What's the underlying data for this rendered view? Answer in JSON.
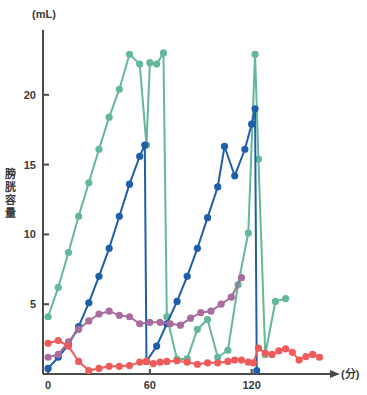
{
  "chart_data": {
    "type": "line",
    "title": "",
    "subtitle": "",
    "xlabel": "(分)",
    "ylabel": "膀胱容量",
    "yunit": "(mL)",
    "xlim": [
      -3,
      165
    ],
    "ylim": [
      0,
      24.5
    ],
    "xticks": [
      0,
      60,
      120
    ],
    "xticklabels": [
      "0",
      "60",
      "120"
    ],
    "yticks": [
      5,
      10,
      15,
      20
    ],
    "yticklabels": [
      "5",
      "10",
      "15",
      "20"
    ],
    "grid": false,
    "legend": "none",
    "series": [
      {
        "name": "green",
        "color": "#63b79a",
        "x": [
          0,
          6,
          12,
          18,
          24,
          30,
          36,
          42,
          48,
          54,
          58,
          60,
          64,
          68,
          70,
          76,
          82,
          88,
          94,
          100,
          106,
          112,
          118,
          122,
          124,
          128,
          134,
          140
        ],
        "y": [
          4.1,
          6.2,
          8.7,
          11.3,
          13.7,
          16.1,
          18.4,
          20.4,
          22.9,
          22.2,
          16.4,
          22.3,
          22.2,
          23.0,
          4.1,
          1.05,
          1.1,
          3.2,
          3.9,
          1.2,
          1.7,
          6.4,
          10.1,
          22.9,
          15.4,
          1.4,
          5.2,
          5.4
        ]
      },
      {
        "name": "blue",
        "color": "#1f5ea8",
        "x": [
          0,
          6,
          12,
          18,
          24,
          30,
          36,
          42,
          48,
          54,
          57,
          58,
          64,
          70,
          76,
          82,
          88,
          94,
          100,
          104,
          110,
          116,
          120,
          122,
          123
        ],
        "y": [
          0.4,
          1.2,
          2.1,
          3.4,
          5.1,
          7.0,
          9.0,
          11.3,
          13.6,
          15.6,
          16.4,
          0.9,
          2.0,
          3.6,
          5.2,
          7.0,
          9.0,
          11.2,
          13.4,
          16.3,
          14.2,
          16.1,
          17.9,
          19.0,
          0.25
        ]
      },
      {
        "name": "purple",
        "color": "#a86c9e",
        "x": [
          0,
          6,
          12,
          18,
          24,
          30,
          36,
          42,
          48,
          54,
          60,
          66,
          72,
          78,
          84,
          90,
          96,
          102,
          108,
          114
        ],
        "y": [
          1.2,
          1.4,
          2.3,
          3.2,
          3.8,
          4.3,
          4.5,
          4.2,
          4.1,
          3.6,
          3.7,
          3.7,
          3.6,
          3.5,
          4.0,
          4.4,
          4.5,
          5.0,
          5.5,
          6.9
        ]
      },
      {
        "name": "red",
        "color": "#ef5a5a",
        "x": [
          0,
          6,
          12,
          18,
          24,
          30,
          36,
          42,
          48,
          54,
          58,
          62,
          66,
          70,
          76,
          82,
          88,
          94,
          100,
          106,
          110,
          114,
          118,
          121,
          124,
          128,
          132,
          136,
          140,
          144,
          148,
          152,
          156,
          160
        ],
        "y": [
          2.2,
          2.4,
          2.0,
          0.9,
          0.25,
          0.4,
          0.55,
          0.55,
          0.6,
          0.85,
          0.9,
          0.75,
          0.85,
          0.9,
          0.95,
          0.85,
          0.7,
          0.8,
          0.8,
          0.9,
          1.0,
          1.0,
          0.85,
          0.8,
          1.85,
          1.5,
          1.4,
          1.65,
          1.8,
          1.55,
          1.0,
          1.25,
          1.4,
          1.2
        ]
      }
    ]
  },
  "axes": {
    "yunit_label": "(mL)",
    "xunit_label": "(分)",
    "ylabel_chars": [
      "膀",
      "胱",
      "容",
      "量"
    ]
  }
}
